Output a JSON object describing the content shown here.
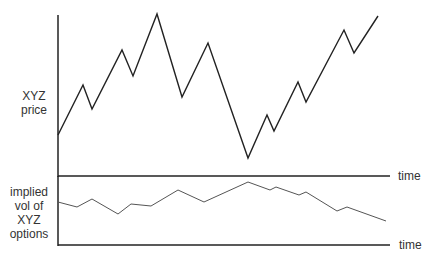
{
  "chart_data": [
    {
      "type": "line",
      "title": "",
      "ylabel": "XYZ price",
      "xlabel": "time",
      "grid": false,
      "series": [
        {
          "name": "XYZ price",
          "color": "#222222",
          "points": [
            [
              58,
              135
            ],
            [
              83,
              85
            ],
            [
              92,
              109
            ],
            [
              122,
              50
            ],
            [
              133,
              76
            ],
            [
              157,
              14
            ],
            [
              182,
              97
            ],
            [
              208,
              43
            ],
            [
              248,
              158
            ],
            [
              267,
              115
            ],
            [
              274,
              131
            ],
            [
              298,
              82
            ],
            [
              306,
              102
            ],
            [
              344,
              30
            ],
            [
              354,
              53
            ],
            [
              378,
              16
            ]
          ]
        }
      ]
    },
    {
      "type": "line",
      "title": "",
      "ylabel": "implied vol of XYZ options",
      "xlabel": "time",
      "grid": false,
      "series": [
        {
          "name": "implied vol of XYZ options",
          "color": "#555555",
          "points": [
            [
              58,
              202
            ],
            [
              77,
              207
            ],
            [
              92,
              199
            ],
            [
              118,
              214
            ],
            [
              131,
              204
            ],
            [
              151,
              206
            ],
            [
              178,
              190
            ],
            [
              204,
              202
            ],
            [
              248,
              182
            ],
            [
              270,
              190
            ],
            [
              276,
              187
            ],
            [
              299,
              195
            ],
            [
              306,
              192
            ],
            [
              337,
              211
            ],
            [
              347,
              207
            ],
            [
              386,
              221
            ]
          ]
        }
      ]
    }
  ],
  "labels": {
    "top_ylabel_line1": "XYZ",
    "top_ylabel_line2": "price",
    "top_xlabel": "time",
    "bottom_ylabel_line1": "implied",
    "bottom_ylabel_line2": "vol of",
    "bottom_ylabel_line3": "XYZ",
    "bottom_ylabel_line4": "options",
    "bottom_xlabel": "time"
  }
}
